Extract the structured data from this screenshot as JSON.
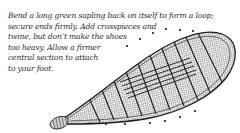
{
  "caption": {
    "lines": [
      "Bend a long green sapling back on itself to form a loop;",
      "secure ends firmly. Add crosspieces and",
      "twine, but don’t make the shoes",
      "too heavy. Allow a firmer",
      "central section to attach",
      "to your foot."
    ]
  },
  "illustration": {
    "subject": "snowshoe",
    "icon": "snowshoe-illustration",
    "ink_color": "#1a1a1a"
  }
}
